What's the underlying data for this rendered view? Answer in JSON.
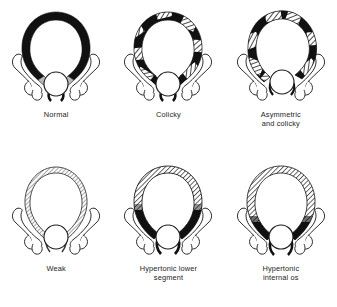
{
  "figure": {
    "background_color": "#ffffff",
    "ink_color": "#111111",
    "hatch_color": "#6f6f6f",
    "outline_color": "#2a2a2a",
    "columns": 3,
    "rows": 2
  },
  "panels": [
    {
      "id": "normal",
      "label": "Normal",
      "wall_pattern": "solid-black-uniform",
      "description": "Uniform thick solid black uterine wall, symmetric pear shape, light gray wall at lower segment near the os",
      "os_label": "internal os circle",
      "adnexa": "symmetric outlined fallopian tube and ovary on each side"
    },
    {
      "id": "colicky",
      "label": "Colicky",
      "wall_pattern": "alternating-black-and-hatched-bands",
      "description": "Alternating solid black and gray hatched bands around a symmetric wall",
      "os_label": "internal os circle",
      "adnexa": "symmetric outlined fallopian tube and ovary on each side"
    },
    {
      "id": "asymmetric-and-colicky",
      "label": "Asymmetric\nand colicky",
      "wall_pattern": "irregular-black-and-hatched-bands",
      "description": "Wavy asymmetric outline with irregular solid black and hatched segments",
      "os_label": "internal os circle",
      "adnexa": "symmetric outlined fallopian tube and ovary on each side"
    },
    {
      "id": "weak",
      "label": "Weak",
      "wall_pattern": "thin-light-hatched",
      "description": "Thin uterine wall with fine light gray hatching throughout, no solid black",
      "os_label": "internal os circle",
      "adnexa": "symmetric outlined fallopian tube and ovary on each side"
    },
    {
      "id": "hypertonic-lower-segment",
      "label": "Hypertonic lower\nsegment",
      "wall_pattern": "hatched-fundus-solid-black-lower-segment",
      "description": "Hatched fundus and upper wall with thick solid black lower segment converging on the os",
      "os_label": "internal os circle",
      "adnexa": "symmetric outlined fallopian tube and ovary on each side"
    },
    {
      "id": "hypertonic-internal-os",
      "label": "Hypertonic\ninternal os",
      "wall_pattern": "hatched-wall-solid-black-at-os",
      "description": "Hatched wall throughout with solid black thickening concentrated at the internal os",
      "os_label": "internal os circle",
      "adnexa": "symmetric outlined fallopian tube and ovary on each side"
    }
  ]
}
